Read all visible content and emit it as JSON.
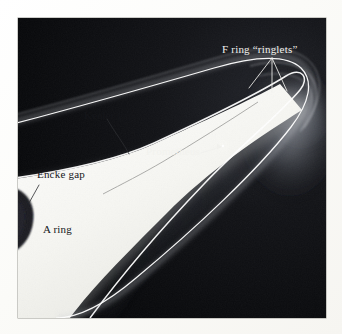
{
  "figure": {
    "kind": "annotated-photograph",
    "background_color": "#ffffff",
    "photo": {
      "left": 18,
      "top": 18,
      "width": 308,
      "height": 300,
      "background_color": "#07080a",
      "border_color": "#9a9a93"
    }
  },
  "annotations": [
    {
      "id": "f-ring-ringlets",
      "text": "F ring “ringlets”",
      "color": "#f2f2ee",
      "font_size": 11,
      "x": 222,
      "y": 44,
      "leader": {
        "type": "fan",
        "color": "#f2f2ee",
        "apex": [
          272,
          58
        ],
        "tips": [
          [
            249,
            88
          ],
          [
            272,
            92
          ],
          [
            287,
            91
          ]
        ]
      }
    },
    {
      "id": "keeler-gap",
      "text": "Keeler gap",
      "color": "#15161a",
      "font_size": 11,
      "x": 84,
      "y": 110,
      "leader": {
        "type": "curve",
        "color": "#2a2b2f",
        "from": [
          107,
          119
        ],
        "to": [
          129,
          154
        ]
      }
    },
    {
      "id": "prometheus",
      "text": "Prometheus",
      "color": "#f2f2ee",
      "font_size": 11,
      "x": 146,
      "y": 146,
      "leader": {
        "type": "arrow",
        "color": "#f2f2ee",
        "from": [
          201,
          153
        ],
        "to": [
          221,
          147
        ],
        "target_dot": [
          223,
          146
        ]
      }
    },
    {
      "id": "encke-gap",
      "text": "Encke gap",
      "color": "#15161a",
      "font_size": 11,
      "x": 37,
      "y": 169,
      "leader": {
        "type": "line",
        "color": "#2a2b2f",
        "from": [
          38,
          183
        ],
        "to": [
          28,
          201
        ]
      }
    },
    {
      "id": "a-ring",
      "text": "A ring",
      "color": "#15161a",
      "font_size": 11,
      "x": 43,
      "y": 224,
      "leader": null
    }
  ],
  "features": {
    "a_ring_body": {
      "name": "A ring",
      "description": "broad bright ring body filling lower-left, rounded outer edge",
      "color": "#f4f4f0"
    },
    "encke_gap": {
      "name": "Encke gap",
      "description": "dark crescent notch inside the bright A ring",
      "color": "#26262a"
    },
    "keeler_gap": {
      "name": "Keeler gap",
      "description": "thin dark line just inside the A ring outer edge",
      "color": "#8f8f8c"
    },
    "roche_division": {
      "name": "Roche division",
      "description": "dark band between A ring edge and F ring",
      "color": "#101114"
    },
    "f_ring": {
      "name": "F ring",
      "description": "narrow bright strand outside the A ring",
      "color": "#ffffff"
    },
    "prometheus": {
      "name": "Prometheus",
      "description": "small bright moon point inside the Roche division",
      "color": "#ffffff"
    },
    "ansa_glow": {
      "name": "ansa glow",
      "description": "diffuse haze where the rings turn at the right limb",
      "color": "#b9bcc2"
    }
  }
}
